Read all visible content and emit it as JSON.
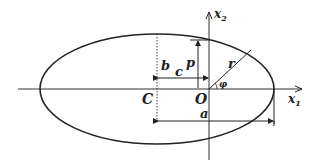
{
  "diagram": {
    "type": "ellipse-geometry",
    "axes": {
      "horizontal_label": "x",
      "horizontal_sub": "1",
      "vertical_label": "x",
      "vertical_sub": "2"
    },
    "points": {
      "center": "C",
      "origin": "O"
    },
    "dimensions": {
      "semi_major": "a",
      "semi_minor": "b",
      "focal_distance": "c",
      "semi_latus_rectum": "p",
      "radius": "r",
      "angle": "φ"
    },
    "colors": {
      "stroke": "#222222",
      "background": "#ffffff"
    }
  }
}
